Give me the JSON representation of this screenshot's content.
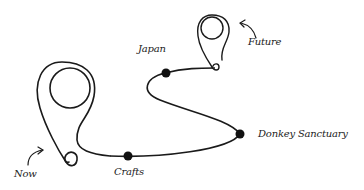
{
  "diagram": {
    "type": "journey-timeline",
    "stroke_color": "#1a1a1a",
    "background": "#ffffff",
    "start": {
      "label": "Now",
      "icon": "map-pin-icon"
    },
    "end": {
      "label": "Future",
      "icon": "map-pin-icon"
    },
    "milestones": [
      {
        "label": "Crafts"
      },
      {
        "label": "Donkey Sanctuary"
      },
      {
        "label": "Japan"
      }
    ]
  }
}
